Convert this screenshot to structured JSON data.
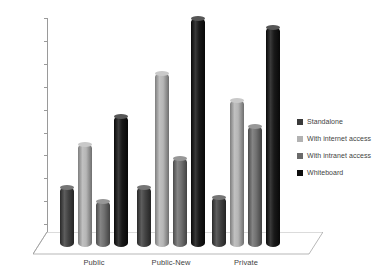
{
  "chart_data": {
    "type": "bar",
    "title": "",
    "subtitle": "",
    "xlabel": "",
    "ylabel": "Percentage",
    "categories": [
      "Public",
      "Public-New",
      "Private"
    ],
    "series": [
      {
        "name": "Standalone",
        "values": [
          26,
          26,
          22
        ],
        "color": "#3a3a3a"
      },
      {
        "name": "With internet access",
        "values": [
          45,
          76,
          64
        ],
        "color": "#b2b2b2"
      },
      {
        "name": "With intranet access",
        "values": [
          20,
          39,
          53
        ],
        "color": "#6a6a6a"
      },
      {
        "name": "Whiteboard",
        "values": [
          57,
          100,
          96
        ],
        "color": "#0d0d0d"
      }
    ],
    "ylim": [
      0,
      100
    ],
    "ytick_step": 10,
    "yticks": [
      0,
      10,
      20,
      30,
      40,
      50,
      60,
      70,
      80,
      90,
      100
    ],
    "ytick_labels": [
      "0",
      "10",
      "20",
      "30",
      "40",
      "50",
      "60",
      "70",
      "80",
      "90",
      "100"
    ],
    "grid": false,
    "legend_position": "right",
    "style": "3d-cylinder-clustered",
    "axis_color": "#9a9a9a",
    "text_color": "#3f3f3f",
    "background": "#ffffff"
  }
}
